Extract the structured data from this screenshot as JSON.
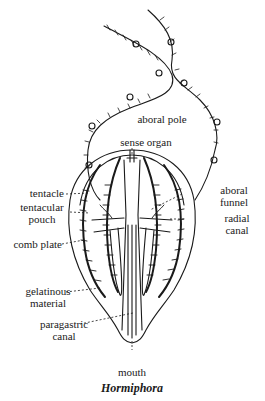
{
  "figure": {
    "title": "Hormiphora",
    "ink_color": "#1a1a1a",
    "background": "#ffffff"
  },
  "labels": {
    "aboral_pole": "aboral pole",
    "sense_organ": "sense organ",
    "tentacle": "tentacle",
    "tentacular_pouch_1": "tentacular",
    "tentacular_pouch_2": "pouch",
    "aboral_funnel_1": "aboral",
    "aboral_funnel_2": "funnel",
    "radial_canal_1": "radial",
    "radial_canal_2": "canal",
    "comb_plate": "comb plate",
    "gelatinous_material_1": "gelatinous",
    "gelatinous_material_2": "material",
    "paragastric_canal_1": "paragastric",
    "paragastric_canal_2": "canal",
    "mouth": "mouth"
  }
}
